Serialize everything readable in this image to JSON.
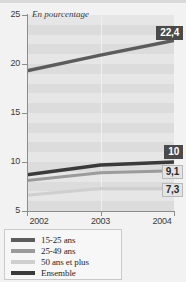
{
  "figure": {
    "unit_note": "En pourcentage",
    "background_color": "#f2f2f2",
    "plot_color": "#e6e6e6"
  },
  "chart_data": {
    "type": "line",
    "title": "",
    "subtitle": "",
    "xlabel": "",
    "ylabel": "En pourcentage",
    "x": [
      "2002",
      "2003",
      "2004"
    ],
    "categories": [
      "2002",
      "2003",
      "2004"
    ],
    "xlim": [
      2002,
      2004
    ],
    "ylim": [
      5,
      25
    ],
    "yticks": [
      5,
      10,
      15,
      20,
      25
    ],
    "xticks": [
      "2002",
      "2003",
      "2004"
    ],
    "grid": "horizontal-bands",
    "legend_position": "bottom-left",
    "series": [
      {
        "name": "15-25 ans",
        "color": "#5c5c5c",
        "values": [
          19.3,
          20.9,
          22.4
        ],
        "end_label": "22,4",
        "end_label_style": "dark"
      },
      {
        "name": "25-49 ans",
        "color": "#9b9b9b",
        "values": [
          8.1,
          8.9,
          9.1
        ],
        "end_label": "9,1",
        "end_label_style": "light"
      },
      {
        "name": "50 ans et plus",
        "color": "#cfcfcf",
        "values": [
          6.6,
          7.3,
          7.3
        ],
        "end_label": "7,3",
        "end_label_style": "light"
      },
      {
        "name": "Ensemble",
        "color": "#3a3a3a",
        "values": [
          8.7,
          9.7,
          10.0
        ],
        "end_label": "10",
        "end_label_style": "dark"
      }
    ]
  },
  "axis": {
    "y_labels": [
      "25",
      "20",
      "15",
      "10",
      "5"
    ],
    "x_labels": [
      "2002",
      "2003",
      "2004"
    ]
  },
  "legend": {
    "items": [
      {
        "label": "15-25 ans",
        "color": "#5c5c5c"
      },
      {
        "label": "25-49 ans",
        "color": "#9b9b9b"
      },
      {
        "label": "50 ans et plus",
        "color": "#cfcfcf"
      },
      {
        "label": "Ensemble",
        "color": "#3a3a3a"
      }
    ]
  },
  "callouts": [
    {
      "text": "22,4",
      "style": "dark"
    },
    {
      "text": "10",
      "style": "dark"
    },
    {
      "text": "9,1",
      "style": "light"
    },
    {
      "text": "7,3",
      "style": "light"
    }
  ]
}
